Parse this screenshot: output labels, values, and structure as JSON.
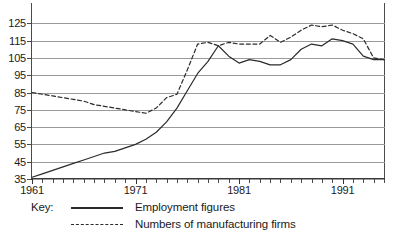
{
  "chart_data": {
    "type": "line",
    "title": "",
    "xlabel": "",
    "ylabel": "",
    "xlim": [
      1961,
      1995
    ],
    "ylim": [
      35,
      128
    ],
    "yticks": [
      35,
      45,
      55,
      65,
      75,
      85,
      95,
      105,
      115,
      125
    ],
    "ytick_labels": [
      "35",
      "45",
      "55",
      "65",
      "75",
      "85",
      "95",
      "105",
      "115",
      "125"
    ],
    "xticks": [
      1961,
      1971,
      1981,
      1991
    ],
    "xtick_labels": [
      "1961",
      "1971",
      "1981",
      "1991"
    ],
    "xtick_minor_step": 1,
    "grid": true,
    "grid_axis": "y",
    "legend_position": "below",
    "x": [
      1961,
      1962,
      1963,
      1964,
      1965,
      1966,
      1967,
      1968,
      1969,
      1970,
      1971,
      1972,
      1973,
      1974,
      1975,
      1976,
      1977,
      1978,
      1979,
      1980,
      1981,
      1982,
      1983,
      1984,
      1985,
      1986,
      1987,
      1988,
      1989,
      1990,
      1991,
      1992,
      1993,
      1994,
      1995
    ],
    "series": [
      {
        "name": "Employment figures",
        "style": "solid",
        "color": "#2b2b2b",
        "values": [
          36,
          38,
          40,
          42,
          44,
          46,
          48,
          50,
          51,
          53,
          55,
          58,
          62,
          68,
          76,
          86,
          96,
          103,
          112,
          106,
          102,
          104,
          103,
          101,
          101,
          104,
          110,
          113,
          112,
          116,
          115,
          113,
          106,
          104,
          104
        ]
      },
      {
        "name": "Numbers of manufacturing firms",
        "style": "dashed",
        "color": "#2b2b2b",
        "values": [
          85,
          84,
          83,
          82,
          81,
          80,
          78,
          77,
          76,
          75,
          74,
          73,
          76,
          82,
          84,
          98,
          113,
          114,
          112,
          114,
          113,
          113,
          113,
          118,
          114,
          117,
          121,
          124,
          123,
          124,
          121,
          119,
          116,
          105,
          104
        ]
      }
    ]
  },
  "legend": {
    "key_label": "Key:",
    "entries": [
      {
        "label": "Employment figures",
        "style": "solid"
      },
      {
        "label": "Numbers of manufacturing firms",
        "style": "dashed"
      }
    ]
  }
}
